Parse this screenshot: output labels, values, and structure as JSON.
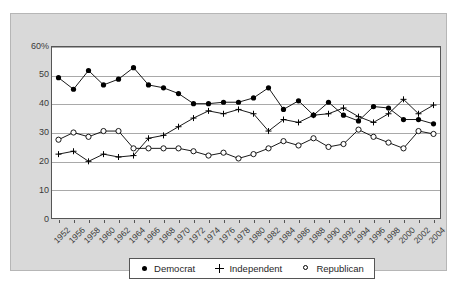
{
  "chart_data": {
    "type": "line",
    "title": "",
    "xlabel": "",
    "ylabel": "",
    "ylim": [
      0,
      60
    ],
    "yticks": [
      "0",
      "10",
      "20",
      "30",
      "40",
      "50",
      "60%"
    ],
    "grid": true,
    "legend_position": "bottom",
    "categories": [
      "1952",
      "1956",
      "1958",
      "1960",
      "1962",
      "1964",
      "1966",
      "1968",
      "1970",
      "1972",
      "1974",
      "1976",
      "1978",
      "1980",
      "1982",
      "1984",
      "1986",
      "1988",
      "1990",
      "1992",
      "1994",
      "1996",
      "1998",
      "2000",
      "2002",
      "2004"
    ],
    "series": [
      {
        "name": "Democrat",
        "marker": "filled-circle",
        "values": [
          49,
          45,
          51.5,
          46.5,
          48.5,
          52.5,
          46.5,
          45.5,
          43.5,
          40,
          40,
          40.5,
          40.5,
          42,
          45.5,
          38,
          41,
          36,
          40.5,
          36,
          34,
          39,
          38.5,
          34.5,
          34.5,
          33
        ]
      },
      {
        "name": "Independent",
        "marker": "plus",
        "values": [
          22.5,
          23.5,
          20,
          22.5,
          21.5,
          22,
          28,
          29,
          32,
          35,
          37.5,
          36.5,
          38,
          36.5,
          30.5,
          34.5,
          33.5,
          36,
          36.5,
          38.5,
          35.5,
          33.5,
          36.5,
          41.5,
          36.5,
          39.5
        ]
      },
      {
        "name": "Republican",
        "marker": "open-circle",
        "values": [
          27.5,
          30,
          28.5,
          30.5,
          30.5,
          24.5,
          24.5,
          24.5,
          24.5,
          23.5,
          22,
          23,
          21,
          22.5,
          24.5,
          27,
          25.5,
          28,
          25,
          26,
          31,
          28.5,
          26.5,
          24.5,
          30.5,
          29.5
        ]
      }
    ]
  },
  "legend": {
    "items": [
      {
        "label": "Democrat",
        "marker": "filled-circle"
      },
      {
        "label": "Independent",
        "marker": "plus"
      },
      {
        "label": "Republican",
        "marker": "open-circle"
      }
    ]
  }
}
